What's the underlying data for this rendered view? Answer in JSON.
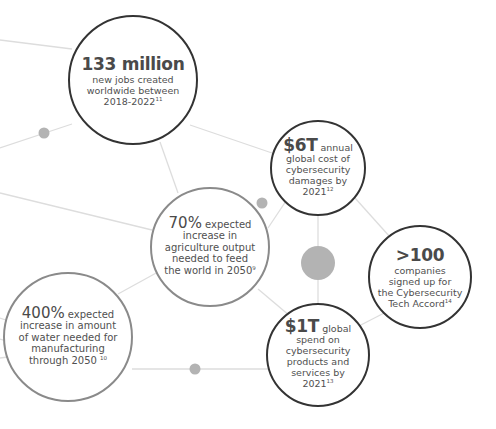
{
  "colors": {
    "dark_stroke": "#333333",
    "gray_stroke": "#8a8a8a",
    "connector": "#dddddd",
    "dot": "#b3b3b3",
    "text": "#505050"
  },
  "nodes": [
    {
      "id": "jobs",
      "headline": "133 million",
      "headline_suffix": "",
      "lines": [
        "new jobs created",
        "worldwide between",
        "2018-2022"
      ],
      "footnote": "11"
    },
    {
      "id": "cyber-damage",
      "headline": "$6T",
      "headline_suffix": " annual",
      "lines": [
        "global cost of",
        "cybersecurity",
        "damages by",
        "2021"
      ],
      "footnote": "12"
    },
    {
      "id": "agriculture",
      "headline": "70%",
      "headline_suffix": " expected",
      "lines": [
        "increase in",
        "agriculture output",
        "needed to feed",
        "the world in 2050"
      ],
      "footnote": "9"
    },
    {
      "id": "tech-accord",
      "headline": ">100",
      "headline_suffix": "",
      "lines": [
        "companies",
        "signed up for",
        "the Cybersecurity",
        "Tech Accord"
      ],
      "footnote": "14"
    },
    {
      "id": "water",
      "headline": "400%",
      "headline_suffix": " expected",
      "lines": [
        "increase in amount",
        "of water needed for",
        "manufacturing",
        "through 2050 "
      ],
      "footnote": "10"
    },
    {
      "id": "cyber-spend",
      "headline": "$1T",
      "headline_suffix": " global",
      "lines": [
        "spend on",
        "cybersecurity",
        "products and",
        "services by",
        "2021"
      ],
      "footnote": "13"
    }
  ]
}
